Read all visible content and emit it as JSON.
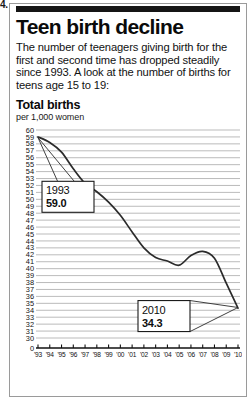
{
  "page_artifact": "4.",
  "headline": "Teen birth decline",
  "deck": "The number of teenagers giving birth for the first and second time has dropped steadily since 1993. A look at the number of births for teens age 15 to 19:",
  "chart_section": {
    "title": "Total births",
    "unit": "per 1,000 women"
  },
  "chart_data": {
    "type": "line",
    "title": "Total births",
    "subtitle": "per 1,000 women",
    "xlabel": "",
    "ylabel": "per 1,000 women",
    "grid": true,
    "legend_position": "none",
    "axis_break": true,
    "ylim": [
      30,
      60
    ],
    "baseline_label": "0",
    "ytick_labels": [
      "60",
      "59",
      "58",
      "57",
      "56",
      "55",
      "54",
      "53",
      "52",
      "51",
      "50",
      "49",
      "48",
      "47",
      "46",
      "45",
      "44",
      "43",
      "42",
      "41",
      "40",
      "39",
      "38",
      "37",
      "36",
      "35",
      "34",
      "33",
      "32",
      "31",
      "30",
      "0"
    ],
    "yticks": [
      60,
      59,
      58,
      57,
      56,
      55,
      54,
      53,
      52,
      51,
      50,
      49,
      48,
      47,
      46,
      45,
      44,
      43,
      42,
      41,
      40,
      39,
      38,
      37,
      36,
      35,
      34,
      33,
      32,
      31,
      30
    ],
    "categories": [
      "'93",
      "'94",
      "'95",
      "'96",
      "'97",
      "'98",
      "'99",
      "'00",
      "'01",
      "'02",
      "'03",
      "'04",
      "'05",
      "'06",
      "'07",
      "'08",
      "'09",
      "'10"
    ],
    "x": [
      1993,
      1994,
      1995,
      1996,
      1997,
      1998,
      1999,
      2000,
      2001,
      2002,
      2003,
      2004,
      2005,
      2006,
      2007,
      2008,
      2009,
      2010
    ],
    "values": [
      59.0,
      58.2,
      56.8,
      54.4,
      52.3,
      51.1,
      49.6,
      47.7,
      45.3,
      43.0,
      41.6,
      41.1,
      40.5,
      41.9,
      42.5,
      41.5,
      37.9,
      34.3
    ],
    "series": [
      {
        "name": "Total births per 1,000 women",
        "values": [
          59.0,
          58.2,
          56.8,
          54.4,
          52.3,
          51.1,
          49.6,
          47.7,
          45.3,
          43.0,
          41.6,
          41.1,
          40.5,
          41.9,
          42.5,
          41.5,
          37.9,
          34.3
        ]
      }
    ],
    "annotations": [
      {
        "id": "start",
        "year": "1993",
        "value": "59.0",
        "x": 1993,
        "y": 59.0
      },
      {
        "id": "end",
        "year": "2010",
        "value": "34.3",
        "x": 2010,
        "y": 34.3
      }
    ]
  }
}
